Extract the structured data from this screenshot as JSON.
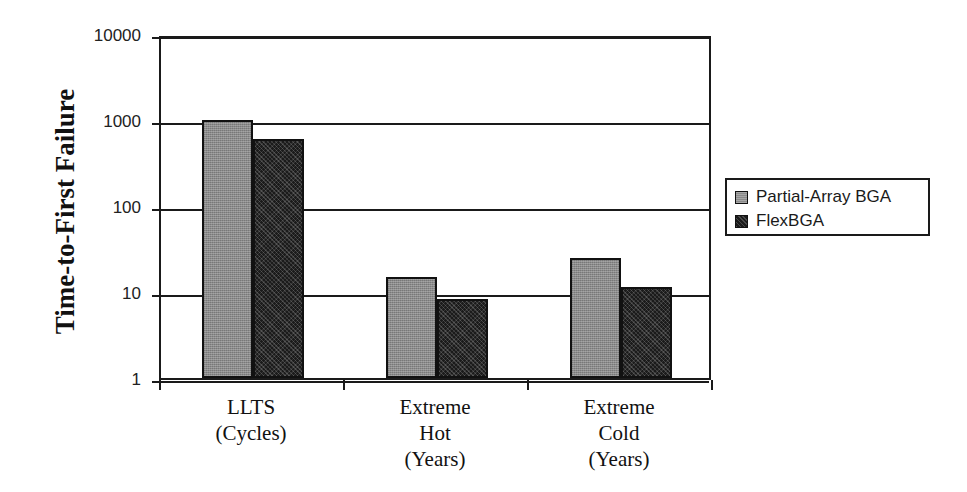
{
  "chart_data": {
    "type": "bar",
    "title": "",
    "subtitle": "",
    "xlabel": "",
    "ylabel": "Time-to-First Failure",
    "yscale": "log",
    "ylim": [
      1,
      10000
    ],
    "ytick_labels": [
      "1",
      "10",
      "100",
      "1000",
      "10000"
    ],
    "ytick_values": [
      1,
      10,
      100,
      1000,
      10000
    ],
    "grid": true,
    "legend_position": "right",
    "categories": [
      "LLTS\n(Cycles)",
      "Extreme\nHot\n(Years)",
      "Extreme\nCold\n(Years)"
    ],
    "category_lines": [
      [
        "LLTS",
        "(Cycles)"
      ],
      [
        "Extreme",
        "Hot",
        "(Years)"
      ],
      [
        "Extreme",
        "Cold",
        "(Years)"
      ]
    ],
    "series": [
      {
        "name": "Partial-Array BGA",
        "color": "#8a8a8a",
        "values": [
          1000,
          15,
          25
        ]
      },
      {
        "name": "FlexBGA",
        "color": "#1b1b1b",
        "values": [
          600,
          8.3,
          11.5
        ]
      }
    ]
  },
  "axis": {
    "y_title": "Time-to-First Failure",
    "y_ticks": [
      {
        "label": "10000",
        "value": 10000
      },
      {
        "label": "1000",
        "value": 1000
      },
      {
        "label": "100",
        "value": 100
      },
      {
        "label": "10",
        "value": 10
      },
      {
        "label": "1",
        "value": 1
      }
    ]
  },
  "legend": {
    "entries": [
      {
        "label": "Partial-Array BGA"
      },
      {
        "label": "FlexBGA"
      }
    ]
  }
}
